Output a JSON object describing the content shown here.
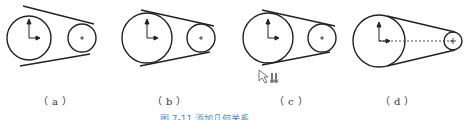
{
  "figure": {
    "panels": [
      {
        "id": "a",
        "label": "（a）"
      },
      {
        "id": "b",
        "label": "（b）"
      },
      {
        "id": "c",
        "label": "（c）"
      },
      {
        "id": "d",
        "label": "（d）"
      }
    ],
    "caption": "图 7-11  添加几何关系",
    "colors": {
      "line": "#222222",
      "caption": "#3a8fd8"
    }
  }
}
